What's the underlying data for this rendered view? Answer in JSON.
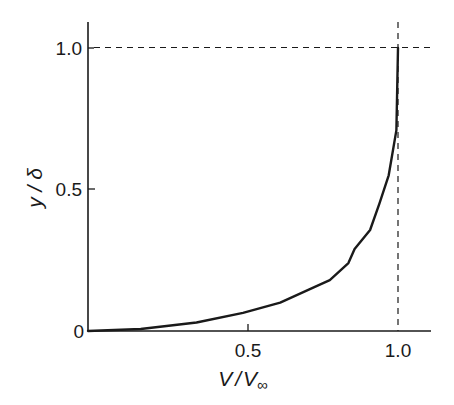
{
  "chart_data": {
    "type": "line",
    "title": "",
    "xlabel": "V / V∞",
    "ylabel": "y / δ",
    "xlim": [
      0,
      1.1
    ],
    "ylim": [
      0,
      1.1
    ],
    "grid": false,
    "legend": null,
    "x_ticks": [
      {
        "value": 0.5,
        "label": "0.5"
      },
      {
        "value": 1.0,
        "label": "1.0"
      }
    ],
    "y_ticks": [
      {
        "value": 0,
        "label": "0"
      },
      {
        "value": 0.5,
        "label": "0.5"
      },
      {
        "value": 1.0,
        "label": "1.0"
      }
    ],
    "reference_lines": [
      {
        "orientation": "horizontal",
        "value": 1.0,
        "style": "dashed"
      },
      {
        "orientation": "vertical",
        "value": 1.0,
        "style": "dashed"
      }
    ],
    "series": [
      {
        "name": "velocity profile",
        "x": [
          0.0,
          0.17,
          0.35,
          0.5,
          0.62,
          0.73,
          0.78,
          0.84,
          0.86,
          0.91,
          0.94,
          0.97,
          0.995,
          1.0
        ],
        "y": [
          0.0,
          0.007,
          0.03,
          0.064,
          0.1,
          0.155,
          0.18,
          0.24,
          0.29,
          0.357,
          0.45,
          0.55,
          0.71,
          1.0
        ]
      }
    ]
  },
  "labels": {
    "x_axis_main": "V",
    "x_axis_slash": "/",
    "x_axis_sub": "V",
    "x_axis_inf": "∞",
    "y_axis": "y / δ",
    "x_tick_05": "0.5",
    "x_tick_10": "1.0",
    "y_tick_0": "0",
    "y_tick_05": "0.5",
    "y_tick_10": "1.0"
  }
}
